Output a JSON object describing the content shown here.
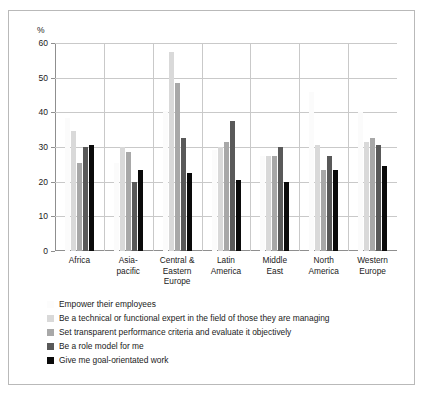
{
  "chart_data": {
    "type": "bar",
    "title": "",
    "xlabel": "",
    "ylabel": "%",
    "ylim": [
      0,
      60
    ],
    "yticks": [
      0,
      10,
      20,
      30,
      40,
      50,
      60
    ],
    "ytick_labels": [
      "0",
      "10",
      "20",
      "30",
      "40",
      "50",
      "60"
    ],
    "grid": true,
    "legend_position": "below",
    "categories": [
      "Africa",
      "Asia-pacific",
      "Central & Eastern Europe",
      "Latin America",
      "Middle East",
      "North America",
      "Western Europe"
    ],
    "category_lines": [
      [
        "Africa"
      ],
      [
        "Asia-",
        "pacific"
      ],
      [
        "Central &",
        "Eastern",
        "Europe"
      ],
      [
        "Latin",
        "America"
      ],
      [
        "Middle",
        "East"
      ],
      [
        "North",
        "America"
      ],
      [
        "Western",
        "Europe"
      ]
    ],
    "series": [
      {
        "name": "Empower their employees",
        "color": "#fcfcfc",
        "values": [
          38.5,
          25.5,
          40.5,
          29.0,
          27.5,
          46.0,
          40.0
        ]
      },
      {
        "name": "Be a technical or functional expert in the field of those they are managing",
        "color": "#d9d9d9",
        "values": [
          34.5,
          30.0,
          57.5,
          30.0,
          27.5,
          30.5,
          31.5
        ]
      },
      {
        "name": "Set transparent performance criteria and evaluate it objectively",
        "color": "#a8a8a8",
        "values": [
          25.5,
          28.5,
          48.5,
          31.5,
          27.5,
          23.5,
          32.5
        ]
      },
      {
        "name": "Be a role model for me",
        "color": "#595959",
        "values": [
          30.0,
          20.0,
          32.5,
          37.5,
          30.0,
          27.5,
          30.5
        ]
      },
      {
        "name": "Give me goal-orientated work",
        "color": "#0a0a0a",
        "values": [
          30.7,
          23.5,
          22.5,
          20.5,
          20.0,
          23.5,
          24.5
        ]
      }
    ]
  }
}
